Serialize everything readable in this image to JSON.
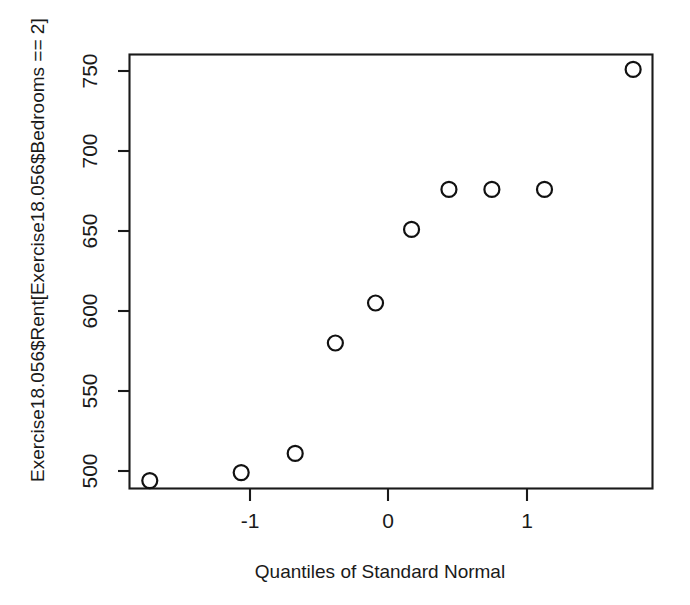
{
  "chart_data": {
    "type": "scatter",
    "title": "",
    "subtitle": "",
    "xlabel": "Quantiles of Standard Normal",
    "ylabel": "Exercise18.056$Rent[Exercise18.056$Bedrooms == 2]",
    "xlim": [
      -2.0,
      2.08
    ],
    "ylim": [
      486,
      758
    ],
    "xticks": [
      -1,
      0,
      1
    ],
    "xticklabels": [
      "-1",
      "0",
      "1"
    ],
    "yticks": [
      500,
      550,
      600,
      650,
      700,
      750
    ],
    "yticklabels": [
      "500",
      "550",
      "600",
      "650",
      "700",
      "750"
    ],
    "grid": false,
    "legend": null,
    "marker": "open-circle",
    "point_color": "#111111",
    "series": [
      {
        "name": "Rent (2 bedrooms)",
        "x": [
          -1.72,
          -1.06,
          -0.67,
          -0.38,
          -0.09,
          0.17,
          0.44,
          0.75,
          1.13,
          1.77
        ],
        "y": [
          494,
          499,
          511,
          580,
          605,
          651,
          676,
          676,
          676,
          751
        ]
      }
    ]
  },
  "axes": {
    "x_title": "Quantiles of Standard Normal",
    "y_title": "Exercise18.056$Rent[Exercise18.056$Bedrooms == 2]"
  },
  "colors": {
    "background": "#ffffff",
    "foreground": "#1a1a1a",
    "point": "#111111"
  }
}
